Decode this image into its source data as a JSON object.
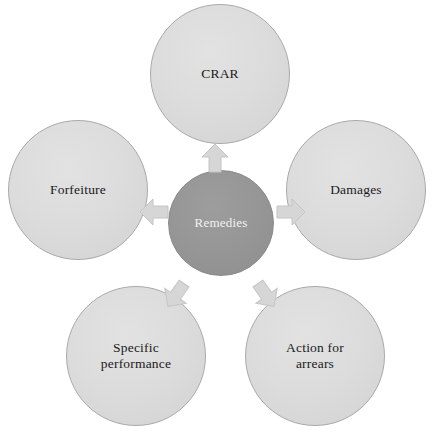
{
  "diagram": {
    "type": "radial-hub-and-spoke",
    "background_color": "#ffffff",
    "hub": {
      "label": "Remedies",
      "fill_color": "#969696",
      "text_color": "#f2f2f2",
      "border_color": "#8a8a8a"
    },
    "node_style": {
      "fill_color": "#dcdcdc",
      "text_color": "#1a1a1a",
      "border_color": "#a9a9a9"
    },
    "arrow_style": {
      "fill_color": "#d6d6d6",
      "border_color": "#c4c4c4",
      "icon": "block-arrow-icon"
    },
    "nodes": [
      {
        "id": "crar",
        "label": "CRAR",
        "position": "top"
      },
      {
        "id": "damages",
        "label": "Damages",
        "position": "right"
      },
      {
        "id": "arrears",
        "label": "Action for\narrears",
        "position": "bottom-right"
      },
      {
        "id": "specific",
        "label": "Specific\nperformance",
        "position": "bottom-left"
      },
      {
        "id": "forfeiture",
        "label": "Forfeiture",
        "position": "left"
      }
    ],
    "arrows": [
      {
        "id": "up",
        "from": "Remedies",
        "to": "CRAR",
        "direction": "up"
      },
      {
        "id": "right",
        "from": "Remedies",
        "to": "Damages",
        "direction": "right"
      },
      {
        "id": "down-right",
        "from": "Remedies",
        "to": "Action for arrears",
        "direction": "down-right"
      },
      {
        "id": "down-left",
        "from": "Remedies",
        "to": "Specific performance",
        "direction": "down-left"
      },
      {
        "id": "left",
        "from": "Remedies",
        "to": "Forfeiture",
        "direction": "left"
      }
    ]
  }
}
